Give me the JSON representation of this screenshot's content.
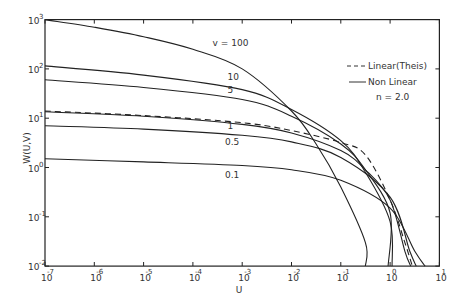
{
  "chart_data": {
    "type": "line",
    "title": "",
    "xlabel": "U",
    "ylabel": "W(U,V)",
    "xscale": "log",
    "yscale": "log",
    "xlim": [
      1e-07,
      10
    ],
    "ylim": [
      0.01,
      1000
    ],
    "grid": false,
    "x_ticks": [
      {
        "base": "10",
        "exp": "-7"
      },
      {
        "base": "10",
        "exp": "-6"
      },
      {
        "base": "10",
        "exp": "-5"
      },
      {
        "base": "10",
        "exp": "-4"
      },
      {
        "base": "10",
        "exp": "-3"
      },
      {
        "base": "10",
        "exp": "-2"
      },
      {
        "base": "10",
        "exp": "-1"
      },
      {
        "base": "10",
        "exp": "0"
      },
      {
        "base": "10",
        "exp": "1"
      }
    ],
    "y_ticks": [
      {
        "base": "10",
        "exp": "3"
      },
      {
        "base": "10",
        "exp": "2"
      },
      {
        "base": "10",
        "exp": "1"
      },
      {
        "base": "10",
        "exp": "0"
      },
      {
        "base": "10",
        "exp": "-1"
      },
      {
        "base": "10",
        "exp": "-2"
      }
    ],
    "legend": {
      "position": "upper right",
      "entries": [
        {
          "label": "Linear(Theis)",
          "style": "dashed"
        },
        {
          "label": "Non Linear",
          "style": "solid"
        }
      ],
      "note": "n = 2.0"
    },
    "series": [
      {
        "name": "v = 100",
        "label": "v = 100",
        "style": "solid",
        "log_u": [
          -7,
          -6,
          -5,
          -4,
          -3,
          -2,
          -1.5,
          -1,
          -0.5,
          -0.5
        ],
        "W": [
          1000,
          700,
          450,
          250,
          100,
          14,
          3,
          0.4,
          0.03,
          0.01
        ],
        "label_pos": {
          "log_u": -3.6,
          "W": 260
        }
      },
      {
        "name": "v = 10",
        "label": "10",
        "style": "solid",
        "log_u": [
          -7,
          -5,
          -3,
          -2,
          -1,
          -0.5,
          0,
          0.04
        ],
        "W": [
          115,
          75,
          38,
          15,
          3.5,
          0.8,
          0.08,
          0.01
        ],
        "label_pos": {
          "log_u": -3.3,
          "W": 55
        }
      },
      {
        "name": "v = 5",
        "label": "5",
        "style": "solid",
        "log_u": [
          -7,
          -5,
          -3,
          -2,
          -1,
          -0.5,
          0,
          -0.04
        ],
        "W": [
          60,
          42,
          24,
          11,
          3,
          0.9,
          0.12,
          0.01
        ],
        "label_pos": {
          "log_u": -3.3,
          "W": 30
        }
      },
      {
        "name": "v = 1",
        "label": "1",
        "style": "solid",
        "log_u": [
          -7,
          -5,
          -3,
          -2,
          -1,
          -0.5,
          0,
          0.3,
          0.42
        ],
        "W": [
          13.5,
          11,
          7.5,
          5,
          2.2,
          0.9,
          0.22,
          0.02,
          0.01
        ],
        "label_pos": {
          "log_u": -3.3,
          "W": 5.5
        }
      },
      {
        "name": "v = 0.5",
        "label": "0.5",
        "style": "solid",
        "log_u": [
          -7,
          -5,
          -3,
          -2,
          -1,
          0,
          0.4,
          0.53
        ],
        "W": [
          7,
          6,
          4.5,
          3.3,
          1.6,
          0.25,
          0.02,
          0.01
        ],
        "label_pos": {
          "log_u": -3.35,
          "W": 2.6
        }
      },
      {
        "name": "v = 0.1",
        "label": "0.1",
        "style": "solid",
        "log_u": [
          -7,
          -5,
          -3,
          -2,
          -1,
          0,
          0.5,
          0.71
        ],
        "W": [
          1.5,
          1.3,
          1.1,
          0.9,
          0.55,
          0.15,
          0.02,
          0.01
        ],
        "label_pos": {
          "log_u": -3.35,
          "W": 0.55
        }
      },
      {
        "name": "Linear (Theis)",
        "label": "",
        "style": "dashed",
        "log_u": [
          -7,
          -5,
          -3,
          -2,
          -1,
          -0.5,
          0,
          0.3,
          0.45
        ],
        "W": [
          14,
          11.3,
          8.1,
          5.6,
          3.2,
          1.8,
          0.22,
          0.03,
          0.01
        ]
      }
    ]
  },
  "legend_labels": {
    "linear": "Linear(Theis)",
    "nonlinear": "Non Linear",
    "note": "n = 2.0"
  },
  "axes": {
    "xlabel": "U",
    "ylabel": "W(U,V)"
  },
  "colors": {
    "line": "#222222",
    "background": "#ffffff"
  }
}
